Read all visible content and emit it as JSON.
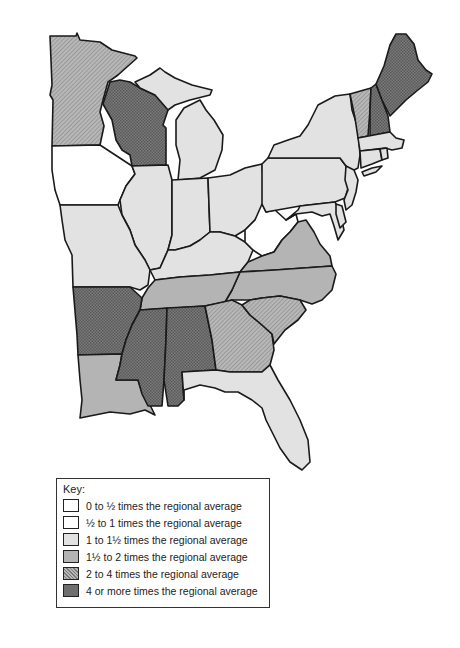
{
  "legend": {
    "title": "Key:",
    "items": [
      {
        "label": "0 to ½ times the regional average",
        "fill": "#ffffff",
        "pattern": "none"
      },
      {
        "label": "½ to 1 times the regional average",
        "fill": "#ffffff",
        "pattern": "none"
      },
      {
        "label": "1 to 1½ times the regional average",
        "fill": "#e2e2e2",
        "pattern": "solid"
      },
      {
        "label": "1½ to 2 times the regional average",
        "fill": "#b4b4b4",
        "pattern": "solid"
      },
      {
        "label": "2 to 4 times the regional average",
        "fill": "#a6a6a6",
        "pattern": "hatch"
      },
      {
        "label": "4 or more times the regional average",
        "fill": "#6e6e6e",
        "pattern": "crosshatch"
      }
    ]
  },
  "map": {
    "region": "Eastern United States",
    "states": [
      {
        "name": "Minnesota",
        "category": 4
      },
      {
        "name": "Wisconsin",
        "category": 5
      },
      {
        "name": "Iowa",
        "category": 1
      },
      {
        "name": "Michigan",
        "category": 2
      },
      {
        "name": "Illinois",
        "category": 2
      },
      {
        "name": "Indiana",
        "category": 2
      },
      {
        "name": "Ohio",
        "category": 2
      },
      {
        "name": "Missouri",
        "category": 2
      },
      {
        "name": "Kentucky",
        "category": 2
      },
      {
        "name": "West Virginia",
        "category": 1
      },
      {
        "name": "Pennsylvania",
        "category": 2
      },
      {
        "name": "New York",
        "category": 2
      },
      {
        "name": "Vermont",
        "category": 4
      },
      {
        "name": "New Hampshire",
        "category": 5
      },
      {
        "name": "Maine",
        "category": 5
      },
      {
        "name": "Massachusetts",
        "category": 2
      },
      {
        "name": "Connecticut",
        "category": 2
      },
      {
        "name": "Rhode Island",
        "category": 2
      },
      {
        "name": "New Jersey",
        "category": 2
      },
      {
        "name": "Delaware",
        "category": 2
      },
      {
        "name": "Maryland",
        "category": 2
      },
      {
        "name": "Virginia",
        "category": 3
      },
      {
        "name": "North Carolina",
        "category": 3
      },
      {
        "name": "Tennessee",
        "category": 3
      },
      {
        "name": "Arkansas",
        "category": 5
      },
      {
        "name": "Louisiana",
        "category": 3
      },
      {
        "name": "Mississippi",
        "category": 5
      },
      {
        "name": "Alabama",
        "category": 5
      },
      {
        "name": "Georgia",
        "category": 4
      },
      {
        "name": "South Carolina",
        "category": 4
      },
      {
        "name": "Florida",
        "category": 2
      }
    ]
  }
}
